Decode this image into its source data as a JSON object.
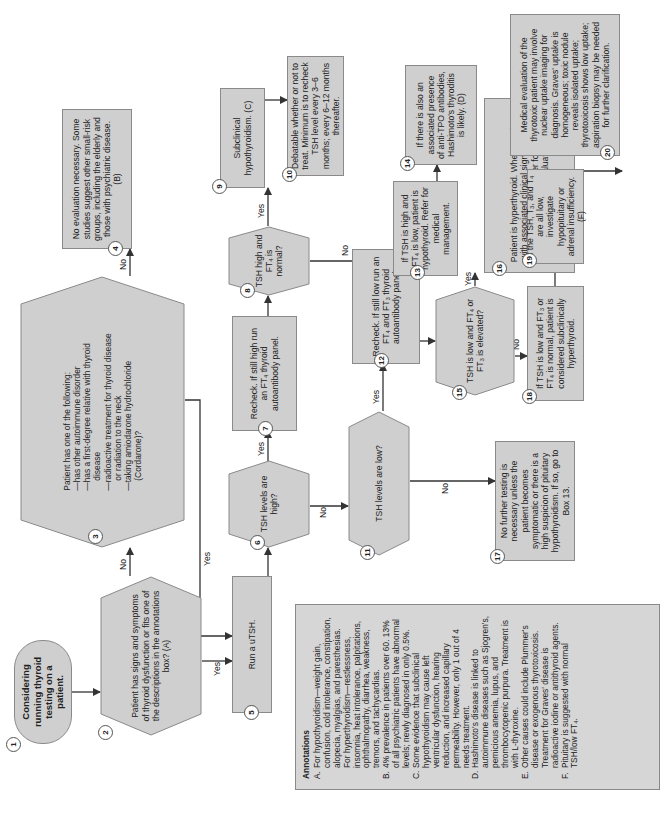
{
  "diagram": {
    "orientation": "rotated 90 degrees counter-clockwise",
    "colors": {
      "box_fill": "#cfcfcf",
      "box_border": "#8a8a8a",
      "line": "#333333",
      "annotation_fill": "#d6d6d6"
    },
    "nodes": [
      {
        "id": 1,
        "shape": "terminal",
        "text": "Considering running thyroid testing on a patient."
      },
      {
        "id": 2,
        "shape": "decision",
        "text": "Patient has signs and symptoms of thyroid dysfunction or fits one of the descriptions in the annotations box? (A)"
      },
      {
        "id": 3,
        "shape": "decision",
        "text_lines": [
          "Patient has one of the following:",
          "—has other autoimmune disorder",
          "—has a first-degree relative with thyroid",
          "   disease",
          "—radioactive treatment for thyroid disease",
          "   or radiation to the neck",
          "—taking amiodarone hydrochloride",
          "   (Cordarone)?"
        ]
      },
      {
        "id": 4,
        "shape": "process",
        "text": "No evaluation necessary. Some studies suggest other small-risk groups, including the elderly and those with psychiatric disease. (B)"
      },
      {
        "id": 5,
        "shape": "process",
        "text": "Run a uTSH."
      },
      {
        "id": 6,
        "shape": "decision",
        "text": "TSH levels are high?"
      },
      {
        "id": 7,
        "shape": "process",
        "text": "Recheck. If still high run an FT4 thyroid autoantibody panel."
      },
      {
        "id": 8,
        "shape": "decision",
        "text": "TSH high and FT4 is normal?"
      },
      {
        "id": 9,
        "shape": "process",
        "text": "Subclinical hypothyroidism. (C)"
      },
      {
        "id": 10,
        "shape": "process",
        "text": "Debatable whether or not to treat. Minimum is to recheck TSH level every 3–6 months; every 6–12 months thereafter."
      },
      {
        "id": 11,
        "shape": "decision",
        "text": "TSH levels are low?"
      },
      {
        "id": 12,
        "shape": "process",
        "text": "Recheck. If still low run an FT4 and FT3 thyroid autoantibody panel."
      },
      {
        "id": 13,
        "shape": "process",
        "text": "If TSH is high and FT4 is low, patient is hypothyroid. Refer for medical management."
      },
      {
        "id": 14,
        "shape": "process",
        "text": "If there is also an associated presence of anti-TPO antibodies, Hashimoto's thyroditis is likely. (D)"
      },
      {
        "id": 15,
        "shape": "decision",
        "text": "TSH is low and FT4 or FT3 is elevated?"
      },
      {
        "id": 16,
        "shape": "process",
        "text": "Patient is hyperthyroid. When consistent with associated clinical signs, it is likely Graves' disease. Refer for medical management or evaluation. (E)"
      },
      {
        "id": 17,
        "shape": "process",
        "text": "No further testing is necessary unless the patient becomes symptomatic or there is a high suspicion of pituitary hypothyroidism. If so, go to Box 13."
      },
      {
        "id": 18,
        "shape": "process",
        "text": "If TSH is low and FT3 or FT4 is normal, patient is considered subclinically hyperthyroid."
      },
      {
        "id": 19,
        "shape": "process",
        "text": "If the TSH, T3, and T4 are all low, investigate hypopituitary or adrenal insufficiency. (F)"
      },
      {
        "id": 20,
        "shape": "process",
        "text": "Medical evaluation of the thyrotoxic patient may involve nuclear uptake imaging for diagnosis. Graves' uptake is homogeneous; toxic nodule reveals isolated uptake; thyrotoxicosis shows low uptake; aspiration biopsy may be needed for further clarification."
      }
    ],
    "edges": [
      {
        "from": 1,
        "to": 2,
        "label": ""
      },
      {
        "from": 2,
        "to": 3,
        "label": "No"
      },
      {
        "from": 2,
        "to": 5,
        "label": "Yes"
      },
      {
        "from": 3,
        "to": 4,
        "label": "No"
      },
      {
        "from": 3,
        "to": 5,
        "label": "Yes"
      },
      {
        "from": 5,
        "to": 6,
        "label": ""
      },
      {
        "from": 6,
        "to": 7,
        "label": "Yes"
      },
      {
        "from": 6,
        "to": 11,
        "label": "No"
      },
      {
        "from": 7,
        "to": 8,
        "label": ""
      },
      {
        "from": 8,
        "to": 9,
        "label": "Yes"
      },
      {
        "from": 8,
        "to": 13,
        "label": "No"
      },
      {
        "from": 9,
        "to": 10,
        "label": ""
      },
      {
        "from": 11,
        "to": 12,
        "label": "Yes"
      },
      {
        "from": 11,
        "to": 17,
        "label": "No"
      },
      {
        "from": 12,
        "to": 15,
        "label": ""
      },
      {
        "from": 13,
        "to": 14,
        "label": ""
      },
      {
        "from": 15,
        "to": 16,
        "label": "Yes"
      },
      {
        "from": 15,
        "to": 18,
        "label": "No"
      },
      {
        "from": 16,
        "to": 20,
        "label": ""
      },
      {
        "from": 18,
        "to": 19,
        "label": ""
      }
    ],
    "labels": {
      "yes": "Yes",
      "no": "No"
    }
  },
  "annotations": {
    "title": "Annotations",
    "items": [
      {
        "key": "A.",
        "text": "For hypothyroidism—weight gain, confusion, cold intolerance, constipation, alopecia, myalgias, and paresthesias. For hyperthyroidism—restlessness, insomnia, heat intolerance, palpitations, ophthalmopathy, diarrhea, weakness, tremors, and tachycardias."
      },
      {
        "key": "B.",
        "text": "4% prevalence in patients over 60. 13% of all psychiatric patients have abnormal levels; newly diagnosed in only 0.5%."
      },
      {
        "key": "C.",
        "text": "Some evidence that subclinical hypothyroidism may cause left ventricular dysfunction, hearing reduction, and increased capillary permeability. However, only 1 out of 4 needs treatment."
      },
      {
        "key": "D.",
        "text": "Hashimoto's disease is linked to autoimmune diseases such as Sjogren's, pernicious anemia, lupus, and thrombocytopenic purpura. Treatment is with L-thyroxine."
      },
      {
        "key": "E.",
        "text": "Other causes could include Plummer's disease or exogenous thyrotoxicosis. Treatment for Graves' disease is radioactive iodine or antithyroid agents."
      },
      {
        "key": "F.",
        "text": "Pituitary is suggested with normal TSH/low FT4."
      }
    ]
  },
  "display": {
    "n": [
      "1",
      "2",
      "3",
      "4",
      "5",
      "6",
      "7",
      "8",
      "9",
      "10",
      "11",
      "12",
      "13",
      "14",
      "15",
      "16",
      "17",
      "18",
      "19",
      "20"
    ],
    "t1": "Considering running thyroid testing on a patient.",
    "t2": "Patient has signs and symptoms of thyroid dysfunction or fits one of the descriptions in the annotations box? (A)",
    "t3": [
      "Patient has one of the following:",
      "—has other autoimmune disorder",
      "—has a first-degree relative with thyroid",
      "disease",
      "—radioactive treatment for thyroid disease",
      "or radiation to the neck",
      "—taking amiodarone hydrochloride",
      "(Cordarone)?"
    ],
    "t4": "No evaluation necessary. Some studies suggest other small-risk groups, including the elderly and those with psychiatric disease. (B)",
    "t5": "Run a uTSH.",
    "t6": "TSH levels are high?",
    "t7a": "Recheck. If still high run an FT",
    "t7s": "4",
    "t7b": " thyroid autoantibody panel.",
    "t8a": "TSH high and FT",
    "t8s": "4",
    "t8b": " is normal?",
    "t9": "Subclinical hypothyroidism. (C)",
    "t10": "Debatable whether or not to treat. Minimum is to recheck TSH level every 3–6 months; every 6–12 months thereafter.",
    "t11": "TSH levels are low?",
    "t12a": "Recheck. If still low run an FT",
    "t12s1": "4",
    "t12b": " and FT",
    "t12s2": "3",
    "t12c": " thyroid autoantibody panel.",
    "t13a": "If TSH is high and FT",
    "t13s": "4",
    "t13b": " is low, patient is hypothyroid. Refer for medical management.",
    "t14": "If there is also an associated presence of anti-TPO antibodies, Hashimoto's thyroditis is likely. (D)",
    "t15a": "TSH is low and FT",
    "t15s1": "4",
    "t15b": " or FT",
    "t15s2": "3",
    "t15c": " is elevated?",
    "t16": "Patient is hyperthyroid. When consistent with associated clinical signs, it is likely Graves' disease. Refer for medical management or evaluation. (E)",
    "t17": "No further testing is necessary unless the patient becomes symptomatic or there is a high suspicion of pituitary hypothyroidism. If so, go to Box 13.",
    "t18a": "If TSH is low and FT",
    "t18s1": "3",
    "t18b": " or FT",
    "t18s2": "4",
    "t18c": " is normal, patient is considered subclinically hyperthyroid.",
    "t19a": "If the TSH, T",
    "t19s1": "3",
    "t19b": ", and T",
    "t19s2": "4",
    "t19c": " are all low, investigate hypopituitary or adrenal insufficiency. (F)",
    "t20": "Medical evaluation of the thyrotoxic patient may involve nuclear uptake imaging for diagnosis. Graves' uptake is homogeneous; toxic nodule reveals isolated uptake; thyrotoxicosis shows low uptake; aspiration biopsy may be needed for further clarification.",
    "annF_a": "Pituitary is suggested with normal TSH/low FT",
    "annF_s": "4",
    "annF_b": "."
  }
}
